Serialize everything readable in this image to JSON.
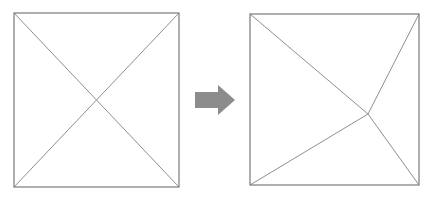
{
  "figure": {
    "background": "#ffffff",
    "border_color": "#7a7a7a",
    "line_color": "#8f8f8f",
    "arrow_color": "#8c8c8c",
    "left_square": {
      "x": 14,
      "y": 13,
      "width": 165,
      "height": 174,
      "intersection": {
        "x": 96.5,
        "y": 100
      },
      "description": "square with diagonals crossing at center"
    },
    "right_square": {
      "x": 250,
      "y": 14,
      "width": 169,
      "height": 171,
      "intersection": {
        "x": 368,
        "y": 114
      },
      "description": "square with corner lines meeting at off-center point"
    },
    "arrow": {
      "direction": "right",
      "tail_x": 195,
      "tail_top": 92,
      "tail_bottom": 108,
      "head_base_x": 218,
      "head_top": 85,
      "head_bottom": 115,
      "tip_x": 235,
      "tip_y": 100
    }
  }
}
